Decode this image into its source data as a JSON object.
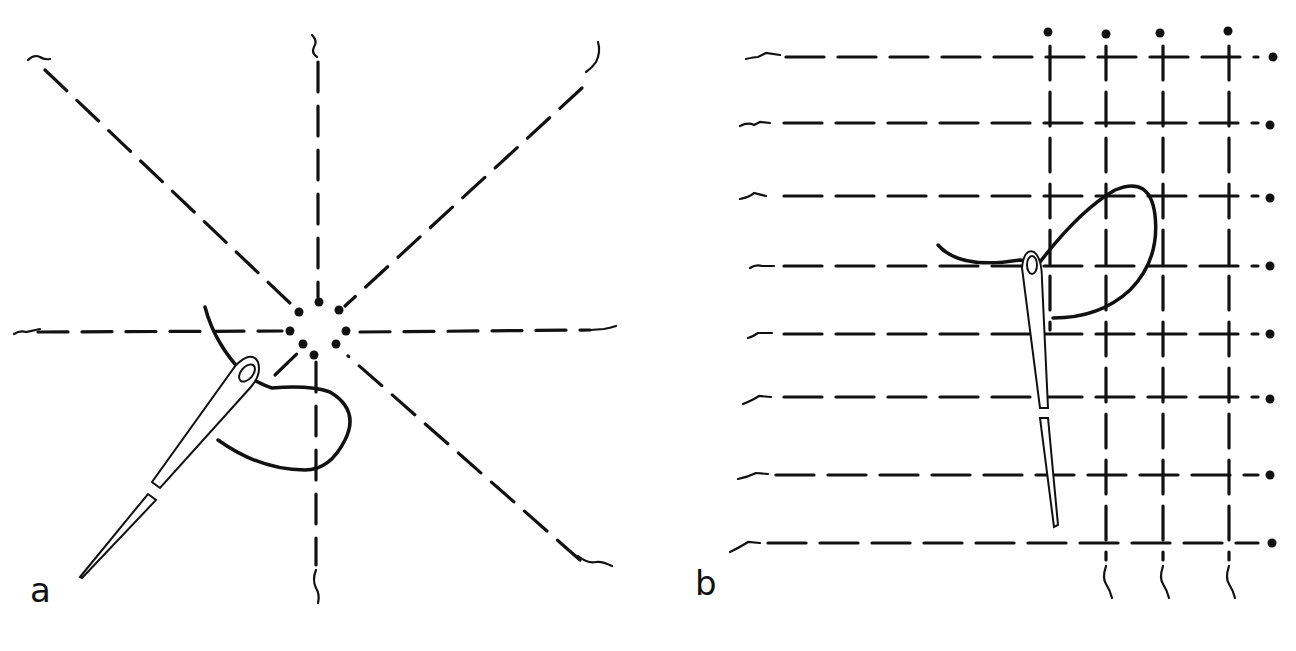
{
  "figure": {
    "panels": [
      {
        "id": "a",
        "label": "a",
        "description": "Eight dashed radial threads meeting at a center ring of dots, with a threaded needle weaving around the center"
      },
      {
        "id": "b",
        "label": "b",
        "description": "Horizontal dashed warp threads crossed by vertical threads forming a grid of crosses, with a threaded needle looping through"
      }
    ]
  },
  "colors": {
    "ink": "#111111",
    "background": "#ffffff"
  },
  "panel_a": {
    "center": [
      313,
      326
    ],
    "spokes": [
      {
        "from": [
          22,
          50
        ],
        "to": [
          292,
          305
        ]
      },
      {
        "from": [
          313,
          38
        ],
        "to": [
          313,
          300
        ]
      },
      {
        "from": [
          598,
          45
        ],
        "to": [
          340,
          305
        ]
      },
      {
        "from": [
          15,
          331
        ],
        "to": [
          285,
          331
        ]
      },
      {
        "from": [
          352,
          331
        ],
        "to": [
          612,
          328
        ]
      },
      {
        "from": [
          598,
          568
        ],
        "to": [
          340,
          352
        ]
      },
      {
        "from": [
          316,
          605
        ],
        "to": [
          316,
          360
        ]
      },
      {
        "from": [
          220,
          400
        ],
        "to": [
          302,
          348
        ]
      }
    ],
    "dots": [
      [
        319,
        302
      ],
      [
        299,
        312
      ],
      [
        338,
        310
      ],
      [
        290,
        331
      ],
      [
        345,
        331
      ],
      [
        303,
        344
      ],
      [
        336,
        344
      ],
      [
        313,
        352
      ]
    ]
  },
  "panel_b": {
    "rows_y": [
      57,
      134,
      214,
      289,
      366,
      433,
      510,
      583
    ],
    "cols_x": [
      1046,
      1104,
      1158,
      1226
    ],
    "right_dot_x": 1270,
    "left_x": 745
  }
}
